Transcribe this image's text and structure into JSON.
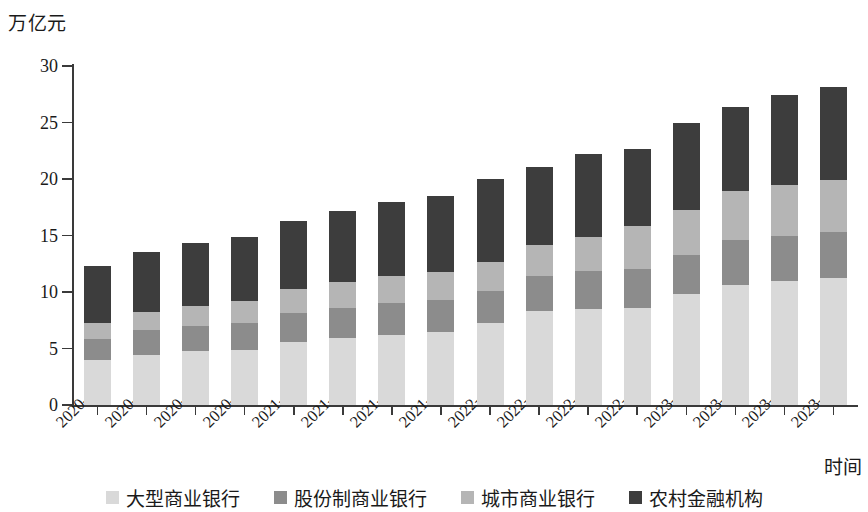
{
  "chart_data": {
    "type": "bar",
    "stacked": true,
    "title": "",
    "subtitle": "",
    "ylabel": "万亿元",
    "xlabel": "时间",
    "ylim": [
      0,
      30
    ],
    "ytick_values": [
      0,
      5,
      10,
      15,
      20,
      25,
      30
    ],
    "ytick_labels": [
      "0",
      "5",
      "10",
      "15",
      "20",
      "25",
      "30"
    ],
    "grid": false,
    "legend_position": "bottom",
    "categories": [
      "2020–03",
      "2020–06",
      "2020–09",
      "2020–12",
      "2021–03",
      "2021–06",
      "2021–09",
      "2021–12",
      "2022–03",
      "2022–06",
      "2022–09",
      "2022–12",
      "2023–03",
      "2023–06",
      "2023–09",
      "2023–12"
    ],
    "series": [
      {
        "name": "大型商业银行",
        "color": "#d9d9d9",
        "values": [
          4.0,
          4.4,
          4.8,
          4.9,
          5.6,
          5.9,
          6.2,
          6.5,
          7.3,
          8.3,
          8.5,
          8.6,
          9.8,
          10.6,
          11.0,
          11.2
        ]
      },
      {
        "name": "股份制商业银行",
        "color": "#8c8c8c",
        "values": [
          1.8,
          2.2,
          2.2,
          2.4,
          2.5,
          2.7,
          2.8,
          2.8,
          2.8,
          3.1,
          3.4,
          3.4,
          3.5,
          4.0,
          4.0,
          4.1
        ]
      },
      {
        "name": "城市商业银行",
        "color": "#b5b5b5",
        "values": [
          1.5,
          1.6,
          1.8,
          1.9,
          2.2,
          2.3,
          2.4,
          2.5,
          2.6,
          2.8,
          3.0,
          3.8,
          4.0,
          4.3,
          4.5,
          4.6
        ]
      },
      {
        "name": "农村金融机构",
        "color": "#3d3d3d",
        "values": [
          5.0,
          5.3,
          5.5,
          5.7,
          6.0,
          6.3,
          6.6,
          6.7,
          7.3,
          6.9,
          7.3,
          6.9,
          7.7,
          7.5,
          7.9,
          8.2
        ]
      }
    ],
    "totals": [
      12.3,
      13.5,
      14.3,
      14.9,
      16.3,
      17.2,
      18.0,
      18.5,
      20.0,
      21.1,
      22.2,
      22.7,
      25.0,
      26.4,
      27.4,
      28.1
    ]
  },
  "legend": {
    "items": [
      {
        "label": "大型商业银行",
        "color": "#d9d9d9"
      },
      {
        "label": "股份制商业银行",
        "color": "#8c8c8c"
      },
      {
        "label": "城市商业银行",
        "color": "#b5b5b5"
      },
      {
        "label": "农村金融机构",
        "color": "#3d3d3d"
      }
    ]
  }
}
